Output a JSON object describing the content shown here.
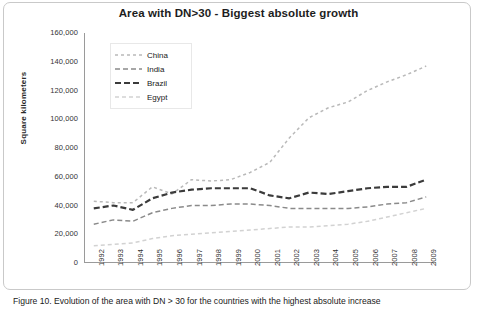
{
  "figure": {
    "caption": "Figure 10. Evolution of the area with DN > 30 for the countries with the highest absolute increase"
  },
  "chart_data": {
    "type": "line",
    "title": "Area with DN>30 - Biggest absolute growth",
    "xlabel": "",
    "ylabel": "Square kilometers",
    "grid": false,
    "legend_position": "top-left",
    "ylim": [
      0,
      160000
    ],
    "ytick_labels": [
      "160,000",
      "140,000",
      "120,000",
      "100,000",
      "80,000",
      "60,000",
      "40,000",
      "20,000",
      "0"
    ],
    "ytick_values": [
      160000,
      140000,
      120000,
      100000,
      80000,
      60000,
      40000,
      20000,
      0
    ],
    "categories": [
      "1992",
      "1993",
      "1994",
      "1995",
      "1996",
      "1997",
      "1998",
      "1999",
      "2000",
      "2001",
      "2002",
      "2003",
      "2004",
      "2005",
      "2006",
      "2007",
      "2008",
      "2009"
    ],
    "series": [
      {
        "name": "China",
        "color": "#b9b9b9",
        "dash": "3,3",
        "width": 1.5,
        "values": [
          43000,
          42000,
          42000,
          53000,
          48000,
          58000,
          57000,
          58000,
          63000,
          70000,
          87000,
          101000,
          108000,
          112000,
          120000,
          126000,
          131000,
          137000
        ]
      },
      {
        "name": "India",
        "color": "#8a8a8a",
        "dash": "5,3",
        "width": 1.5,
        "values": [
          27000,
          30000,
          29000,
          35000,
          38000,
          40000,
          40000,
          41000,
          41000,
          40000,
          38000,
          38000,
          38000,
          38000,
          39000,
          41000,
          42000,
          46000
        ]
      },
      {
        "name": "Brazil",
        "color": "#3b3b3b",
        "dash": "6,3",
        "width": 2.2,
        "values": [
          38000,
          40000,
          37000,
          45000,
          49000,
          51000,
          52000,
          52000,
          52000,
          47000,
          45000,
          49000,
          48000,
          50000,
          52000,
          53000,
          53000,
          58000
        ]
      },
      {
        "name": "Egypt",
        "color": "#d2d2d2",
        "dash": "4,3",
        "width": 1.5,
        "values": [
          12000,
          13000,
          14000,
          17000,
          19000,
          20000,
          21000,
          22000,
          23000,
          24000,
          25000,
          25000,
          26000,
          27000,
          29000,
          32000,
          35000,
          38000
        ]
      }
    ]
  }
}
